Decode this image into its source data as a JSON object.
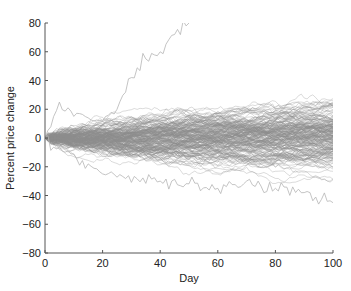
{
  "chart_data": {
    "type": "line",
    "title": "",
    "xlabel": "Day",
    "ylabel": "Percent price change",
    "xlim": [
      0,
      100
    ],
    "ylim": [
      -80,
      80
    ],
    "xticks": [
      0,
      20,
      40,
      60,
      80,
      100
    ],
    "yticks": [
      -80,
      -60,
      -40,
      -20,
      0,
      20,
      40,
      60,
      80
    ],
    "grid": false,
    "legend": null,
    "series_summary": {
      "num_paths": 200,
      "start_value": 0,
      "line_color": "#8c8c8c",
      "day100_range_approx": [
        -45,
        37
      ],
      "day100_central_band_approx": [
        -15,
        20
      ],
      "outlier_path_peak": "exceeds 80 near day 50-60"
    },
    "notable_paths": [
      {
        "name": "high outlier",
        "points": [
          [
            0,
            0
          ],
          [
            5,
            25
          ],
          [
            10,
            15
          ],
          [
            15,
            14
          ],
          [
            20,
            12
          ],
          [
            25,
            20
          ],
          [
            30,
            42
          ],
          [
            35,
            55
          ],
          [
            40,
            60
          ],
          [
            45,
            72
          ],
          [
            50,
            80
          ]
        ]
      },
      {
        "name": "low outlier",
        "points": [
          [
            0,
            0
          ],
          [
            20,
            -25
          ],
          [
            40,
            -30
          ],
          [
            60,
            -35
          ],
          [
            70,
            -30
          ],
          [
            80,
            -35
          ],
          [
            90,
            -38
          ],
          [
            100,
            -45
          ]
        ]
      }
    ]
  }
}
